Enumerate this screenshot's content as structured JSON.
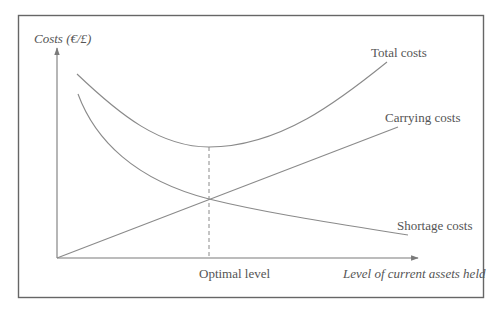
{
  "diagram": {
    "y_axis_label": "Costs (€/£)",
    "x_axis_label": "Level of current assets held",
    "optimal_label": "Optimal level",
    "curves": [
      {
        "name": "Total costs",
        "shape": "U-shaped, minimum at optimal level"
      },
      {
        "name": "Carrying costs",
        "shape": "linear increasing from origin"
      },
      {
        "name": "Shortage costs",
        "shape": "decreasing, convex"
      }
    ],
    "labels": {
      "total": "Total costs",
      "carrying": "Carrying costs",
      "shortage": "Shortage costs"
    },
    "colors": {
      "lines": "#8a8a8a",
      "frame": "#666666",
      "text": "#555555"
    }
  }
}
